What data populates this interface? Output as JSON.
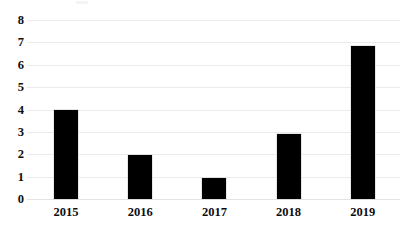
{
  "chart_data": {
    "type": "bar",
    "title": "",
    "subtitle": "",
    "xlabel": "",
    "ylabel": "",
    "categories": [
      "2015",
      "2016",
      "2017",
      "2018",
      "2019"
    ],
    "values": [
      4,
      1.95,
      0.92,
      2.9,
      6.85
    ],
    "series": [
      {
        "name": "",
        "values": [
          4,
          1.95,
          0.92,
          2.9,
          6.85
        ]
      }
    ],
    "ylim": [
      0,
      8
    ],
    "y_ticks": [
      "0",
      "1",
      "2",
      "3",
      "4",
      "5",
      "6",
      "7",
      "8"
    ],
    "y_tick_values": [
      0,
      1,
      2,
      3,
      4,
      5,
      6,
      7,
      8
    ],
    "grid": "horizontal",
    "legend": "none",
    "bar_color": "#000000",
    "gridline_color": "#ebebeb",
    "axis_label_color": "#0d0d0d",
    "background_color": "#ffffff"
  }
}
